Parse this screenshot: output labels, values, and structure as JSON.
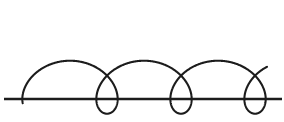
{
  "figure": {
    "name": "prolate-cycloid-diagram",
    "type": "line-drawing",
    "background_color": "#ffffff",
    "width": 284,
    "height": 122
  },
  "chart_data": {
    "type": "line",
    "title": "",
    "subtitle": "",
    "xlabel": "",
    "ylabel": "",
    "grid": false,
    "legend_position": "none",
    "tick_labels_x": [],
    "tick_labels_y": [],
    "annotations": [],
    "xlim": [
      0,
      284
    ],
    "ylim": [
      122,
      0
    ],
    "series": [
      {
        "name": "prolate-cycloid",
        "description": "Trochoid traced by a point outside a circle rolling along a straight line, producing three loops that touch the baseline at cusps.",
        "stroke_color": "#1c1c1c",
        "stroke_width": 2.1,
        "parametric": {
          "formula": "x = a*t - b*sin(t), y = baseline - (a - b*cos(t))",
          "rolling_radius_a": 11.78,
          "tracing_radius_b": 26.5,
          "baseline_y": 99,
          "t_start": 0.92,
          "t_end": 21.3,
          "period_px": 74.0
        },
        "loops": [
          {
            "index": 1,
            "center_x": 70,
            "cusp_x": 70,
            "cusp_y": 99,
            "crossing_x": 70,
            "crossing_y": 25,
            "half_width": 12
          },
          {
            "index": 2,
            "center_x": 144,
            "cusp_x": 144,
            "cusp_y": 99,
            "crossing_x": 144,
            "crossing_y": 25,
            "half_width": 12
          },
          {
            "index": 3,
            "center_x": 218,
            "cusp_x": 218,
            "cusp_y": 99,
            "crossing_x": 218,
            "crossing_y": 25,
            "half_width": 12
          }
        ],
        "arch_peaks": [
          {
            "x": 107,
            "y": 4
          },
          {
            "x": 181,
            "y": 4
          }
        ],
        "endpoints": {
          "start": {
            "x": 33,
            "y": 5
          },
          "end": {
            "x": 255,
            "y": 5
          }
        }
      },
      {
        "name": "baseline",
        "description": "Horizontal straight line the circle rolls along.",
        "stroke_color": "#1c1c1c",
        "stroke_width": 2.4,
        "x_start": 4,
        "x_end": 282,
        "y": 99
      }
    ]
  }
}
